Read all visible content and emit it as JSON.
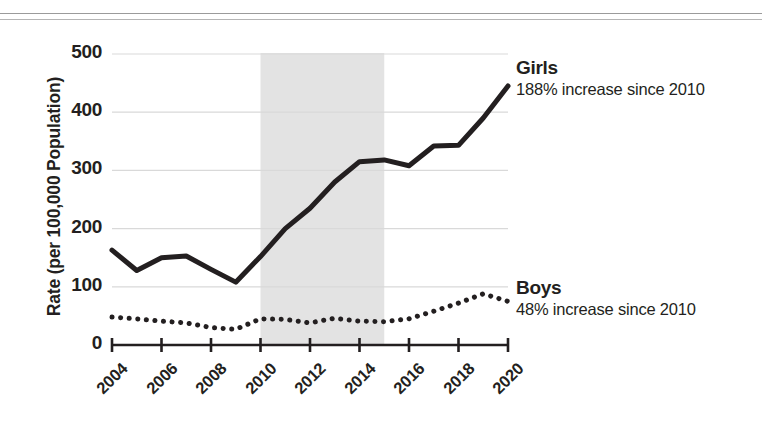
{
  "figure": {
    "background_color": "#ffffff",
    "ink_color": "#231f20",
    "band_color": "#e3e3e3",
    "gridline_color": "#d9d9d9",
    "rule_color": "#9b9b9b"
  },
  "axes": {
    "ylabel": "Rate (per 100,000 Population)",
    "yticks": [
      "0",
      "100",
      "200",
      "300",
      "400",
      "500"
    ],
    "xticks": [
      "2004",
      "2006",
      "2008",
      "2010",
      "2012",
      "2014",
      "2016",
      "2018",
      "2020"
    ]
  },
  "annotations": {
    "girls": {
      "name": "Girls",
      "subtitle": "188% increase since 2010"
    },
    "boys": {
      "name": "Boys",
      "subtitle": "48% increase since 2010"
    }
  },
  "chart_data": {
    "type": "line",
    "title": "",
    "xlabel": "",
    "ylabel": "Rate (per 100,000 Population)",
    "xlim": [
      2004,
      2020
    ],
    "ylim": [
      0,
      500
    ],
    "ytick_values": [
      0,
      100,
      200,
      300,
      400,
      500
    ],
    "xtick_values": [
      2004,
      2006,
      2008,
      2010,
      2012,
      2014,
      2016,
      2018,
      2020
    ],
    "grid": "horizontal",
    "legend": "inline-right-labels",
    "x": [
      2004,
      2005,
      2006,
      2007,
      2008,
      2009,
      2010,
      2011,
      2012,
      2013,
      2014,
      2015,
      2016,
      2017,
      2018,
      2019,
      2020
    ],
    "series": [
      {
        "name": "Girls",
        "style": "solid",
        "linewidth": 5,
        "color": "#231f20",
        "annotation": "188% increase since 2010",
        "values": [
          163,
          128,
          150,
          153,
          130,
          108,
          152,
          200,
          235,
          280,
          315,
          318,
          308,
          342,
          343,
          390,
          445
        ]
      },
      {
        "name": "Boys",
        "style": "dotted",
        "linewidth": 5,
        "color": "#231f20",
        "annotation": "48% increase since 2010",
        "values": [
          48,
          45,
          41,
          38,
          30,
          27,
          45,
          44,
          38,
          46,
          41,
          40,
          45,
          58,
          72,
          88,
          75
        ]
      }
    ],
    "shaded_band": {
      "label": "",
      "x_start": 2010,
      "x_end": 2015,
      "color": "#e3e3e3"
    }
  }
}
